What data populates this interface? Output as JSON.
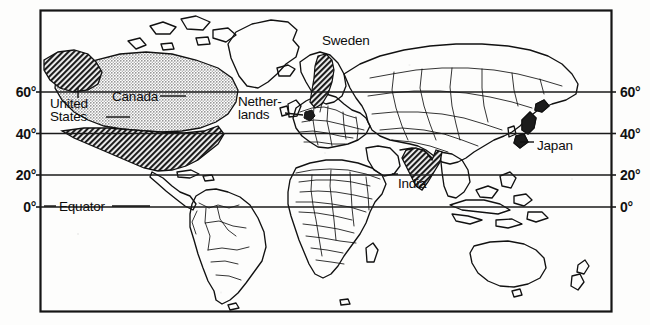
{
  "map": {
    "title": "World map with highlighted countries",
    "frame": {
      "x": 40,
      "y": 10,
      "width": 572,
      "height": 302
    },
    "colors": {
      "ink": "#111111",
      "paper": "#fdfdfc",
      "fill_dark": "#2b2b2b",
      "fill_light": "#b9b9b9",
      "graticule": "#1a1a1a"
    },
    "latitude_labels_left": [
      {
        "text": "60°",
        "value": 60,
        "x": 2,
        "y": 84
      },
      {
        "text": "40°",
        "value": 40,
        "x": 2,
        "y": 126
      },
      {
        "text": "20°",
        "value": 20,
        "x": 2,
        "y": 167
      },
      {
        "text": "0°",
        "value": 0,
        "x": 2,
        "y": 199
      }
    ],
    "latitude_labels_right": [
      {
        "text": "60°",
        "value": 60,
        "x": 618,
        "y": 84
      },
      {
        "text": "40°",
        "value": 40,
        "x": 618,
        "y": 126
      },
      {
        "text": "20°",
        "value": 20,
        "x": 618,
        "y": 167
      },
      {
        "text": "0°",
        "value": 0,
        "x": 618,
        "y": 199
      }
    ],
    "equator": {
      "label": "Equator",
      "x": 57,
      "y": 199
    },
    "place_labels": [
      {
        "name": "united-states",
        "text": "United\nStates",
        "x": 50,
        "y": 103,
        "lines": [
          "United",
          "States"
        ]
      },
      {
        "name": "canada",
        "text": "Canada",
        "x": 112,
        "y": 96
      },
      {
        "name": "sweden",
        "text": "Sweden",
        "x": 322,
        "y": 40
      },
      {
        "name": "netherlands",
        "text": "Nether-\nlands",
        "x": 240,
        "y": 101,
        "lines": [
          "Nether-",
          "lands"
        ]
      },
      {
        "name": "india",
        "text": "India",
        "x": 397,
        "y": 178
      },
      {
        "name": "japan",
        "text": "Japan",
        "x": 537,
        "y": 146
      }
    ],
    "highlighted_countries": [
      {
        "name": "United States",
        "shading": "dark-hatch"
      },
      {
        "name": "Canada",
        "shading": "light-stipple"
      },
      {
        "name": "Sweden",
        "shading": "dark-hatch"
      },
      {
        "name": "Netherlands",
        "shading": "dark-hatch"
      },
      {
        "name": "India",
        "shading": "dark-hatch"
      },
      {
        "name": "Japan",
        "shading": "dark-hatch"
      }
    ]
  }
}
